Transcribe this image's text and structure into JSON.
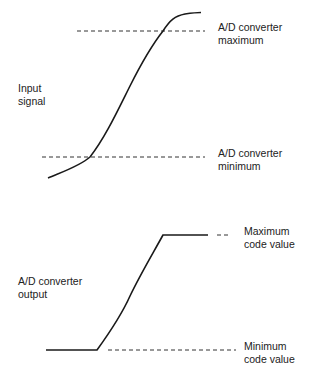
{
  "top_panel": {
    "axis_label_line1": "Input",
    "axis_label_line2": "signal",
    "max_label_line1": "A/D converter",
    "max_label_line2": "maximum",
    "min_label_line1": "A/D converter",
    "min_label_line2": "minimum"
  },
  "bottom_panel": {
    "axis_label_line1": "A/D converter",
    "axis_label_line2": "output",
    "max_label_line1": "Maximum",
    "max_label_line2": "code value",
    "min_label_line1": "Minimum",
    "min_label_line2": "code value"
  },
  "colors": {
    "curve": "#1a1a1a",
    "dashed": "#333333",
    "background": "#ffffff"
  }
}
